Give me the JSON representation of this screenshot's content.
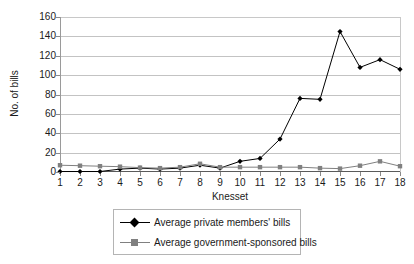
{
  "chart_data": {
    "type": "line",
    "title": "",
    "xlabel": "Knesset",
    "ylabel": "No. of bills",
    "categories": [
      "1",
      "2",
      "3",
      "4",
      "5",
      "6",
      "7",
      "8",
      "9",
      "10",
      "11",
      "12",
      "13",
      "14",
      "15",
      "16",
      "17",
      "18"
    ],
    "x": [
      1,
      2,
      3,
      4,
      5,
      6,
      7,
      8,
      9,
      10,
      11,
      12,
      13,
      14,
      15,
      16,
      17,
      18
    ],
    "xlim": [
      1,
      18
    ],
    "ylim": [
      0,
      160
    ],
    "yticks": [
      0,
      20,
      40,
      60,
      80,
      100,
      120,
      140,
      160
    ],
    "ytick_labels": [
      "0",
      "20",
      "40",
      "60",
      "80",
      "100",
      "120",
      "140",
      "160"
    ],
    "grid": "horizontal",
    "legend_position": "bottom-center",
    "series": [
      {
        "name": "Average private members' bills",
        "marker": "diamond",
        "color": "#000000",
        "values": [
          0.5,
          0.5,
          0.5,
          3,
          4,
          3,
          4,
          7,
          4,
          11,
          14,
          34,
          76,
          75,
          145,
          108,
          116,
          106
        ]
      },
      {
        "name": "Average government-sponsored bills",
        "marker": "square",
        "color": "#808080",
        "values": [
          7,
          6.5,
          6,
          5.5,
          4.5,
          4,
          5,
          8.5,
          5,
          5,
          5,
          5,
          5,
          4,
          3.5,
          6.5,
          11,
          6
        ]
      }
    ]
  },
  "legend": {
    "items": [
      {
        "label": "Average private members' bills",
        "marker": "diamond-marker-icon"
      },
      {
        "label": "Average government-sponsored bills",
        "marker": "square-marker-icon"
      }
    ]
  },
  "colors": {
    "series1": "#000000",
    "series2": "#808080",
    "gridline": "#c3c3c3",
    "axis": "#5a5a5a",
    "text": "#1a1a1a",
    "background": "#ffffff"
  }
}
